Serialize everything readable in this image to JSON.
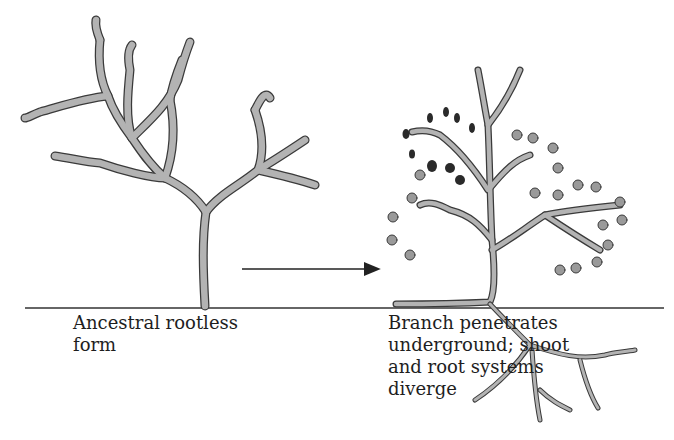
{
  "diagram": {
    "type": "evolutionary-transition",
    "stages": [
      {
        "id": "ancestral",
        "label_lines": [
          "Ancestral rootless",
          "form"
        ],
        "label": "Ancestral rootless\nform"
      },
      {
        "id": "derived",
        "label_lines": [
          "Branch penetrates",
          "underground; shoot",
          "and root systems",
          "diverge"
        ],
        "label": "Branch penetrates\nunderground; shoot\nand root systems\ndiverge"
      }
    ],
    "arrow": {
      "direction": "right",
      "from": "ancestral",
      "to": "derived"
    },
    "colors": {
      "plant_fill": "#b3b3b3",
      "plant_outline": "#3a3a3a",
      "sporangia": "#2a2a2a",
      "ground_line": "#333333",
      "text": "#1e1e1e",
      "background": "#ffffff"
    }
  }
}
